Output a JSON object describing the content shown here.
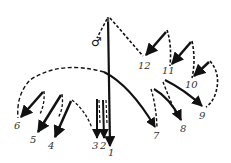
{
  "diagram": {
    "type": "arrow-trajectory diagram",
    "symbol": "♂",
    "labels": [
      "1",
      "2",
      "3",
      "4",
      "5",
      "6",
      "7",
      "8",
      "9",
      "10",
      "11",
      "12"
    ],
    "colors": {
      "stroke": "#111111",
      "label": "#333333",
      "background": "#ffffff"
    }
  }
}
